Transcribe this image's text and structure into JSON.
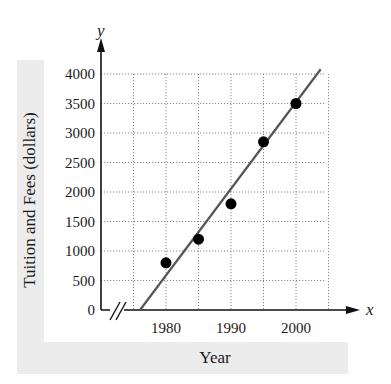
{
  "chart_data": {
    "type": "scatter",
    "title": "",
    "xlabel": "Year",
    "ylabel": "Tuition and Fees (dollars)",
    "x_axis_var": "x",
    "y_axis_var": "y",
    "x_ticks": [
      1980,
      1990,
      2000
    ],
    "y_ticks": [
      0,
      500,
      1000,
      1500,
      2000,
      2500,
      3000,
      3500,
      4000
    ],
    "xlim": [
      1975,
      2005
    ],
    "ylim": [
      0,
      4000
    ],
    "grid": true,
    "axis_break": "x",
    "series": [
      {
        "name": "Data points",
        "type": "scatter",
        "x": [
          1980,
          1985,
          1990,
          1995,
          2000
        ],
        "y": [
          800,
          1200,
          1800,
          2850,
          3500
        ]
      },
      {
        "name": "Linear model",
        "type": "line",
        "x": [
          1976,
          2003.8
        ],
        "y": [
          0,
          4080
        ]
      }
    ],
    "colors": {
      "points": "#000000",
      "line": "#555555",
      "grid": "#888888",
      "band": "#ececec"
    }
  },
  "labels": {
    "xlabel": "Year",
    "ylabel": "Tuition and Fees (dollars)"
  }
}
